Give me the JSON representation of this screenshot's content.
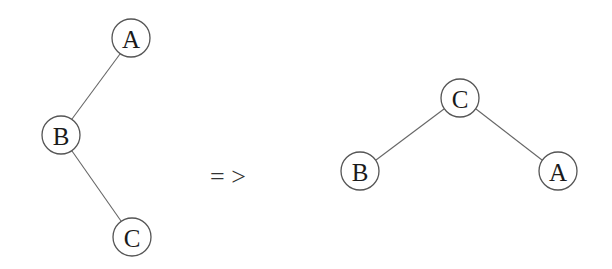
{
  "diagram": {
    "type": "tree-rotation",
    "before": {
      "nodes": [
        {
          "id": "A",
          "label": "A",
          "x": 131,
          "y": 38
        },
        {
          "id": "B",
          "label": "B",
          "x": 61,
          "y": 135
        },
        {
          "id": "C",
          "label": "C",
          "x": 132,
          "y": 237
        }
      ],
      "edges": [
        {
          "from": "A",
          "to": "B"
        },
        {
          "from": "B",
          "to": "C"
        }
      ]
    },
    "arrow": {
      "label": "= >"
    },
    "after": {
      "nodes": [
        {
          "id": "C",
          "label": "C",
          "x": 460,
          "y": 98
        },
        {
          "id": "B",
          "label": "B",
          "x": 360,
          "y": 171
        },
        {
          "id": "A",
          "label": "A",
          "x": 558,
          "y": 171
        }
      ],
      "edges": [
        {
          "from": "C",
          "to": "B"
        },
        {
          "from": "C",
          "to": "A"
        }
      ]
    },
    "node_radius": 19,
    "colors": {
      "stroke": "#555555",
      "edge": "#666666",
      "text": "#1a1a1a",
      "background": "#ffffff"
    }
  }
}
